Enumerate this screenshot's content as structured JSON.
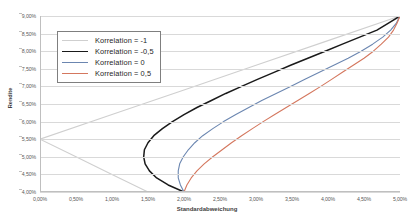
{
  "chart_data": {
    "type": "line",
    "title": "",
    "xlabel": "Standardabweichung",
    "ylabel": "Rendite",
    "xlim": [
      0.0,
      5.0
    ],
    "ylim": [
      4.0,
      9.0
    ],
    "x_ticks": [
      "0,00%",
      "0,50%",
      "1,00%",
      "1,50%",
      "2,00%",
      "2,50%",
      "3,00%",
      "3,50%",
      "4,00%",
      "4,50%",
      "5,00%"
    ],
    "x_tick_values": [
      0.0,
      0.5,
      1.0,
      1.5,
      2.0,
      2.5,
      3.0,
      3.5,
      4.0,
      4.5,
      5.0
    ],
    "y_ticks": [
      "9,00%",
      "8,50%",
      "8,00%",
      "7,50%",
      "7,00%",
      "6,50%",
      "6,00%",
      "5,50%",
      "5,00%",
      "4,50%",
      "4,00%"
    ],
    "y_tick_values": [
      9.0,
      8.5,
      8.0,
      7.5,
      7.0,
      6.5,
      6.0,
      5.5,
      5.0,
      4.5,
      4.0
    ],
    "grid": true,
    "legend_position": "upper-left-inset",
    "series": [
      {
        "name": "Korrelation = -1",
        "color": "#cfcfcf",
        "points": [
          [
            0.0,
            5.5
          ],
          [
            0.5,
            5.0
          ],
          [
            1.0,
            4.5
          ],
          [
            1.5,
            4.0
          ]
        ],
        "points_upper": [
          [
            0.0,
            5.5
          ],
          [
            1.0,
            6.2
          ],
          [
            2.0,
            6.9
          ],
          [
            3.0,
            7.6
          ],
          [
            4.0,
            8.3
          ],
          [
            5.0,
            9.0
          ]
        ]
      },
      {
        "name": "Korrelation = -0,5",
        "color": "#1a1a1a",
        "points": [
          [
            2.0,
            4.0
          ],
          [
            1.78,
            4.2
          ],
          [
            1.62,
            4.4
          ],
          [
            1.52,
            4.6
          ],
          [
            1.46,
            4.8
          ],
          [
            1.44,
            5.0
          ],
          [
            1.45,
            5.2
          ],
          [
            1.5,
            5.4
          ],
          [
            1.58,
            5.6
          ],
          [
            1.7,
            5.8
          ],
          [
            1.84,
            6.0
          ],
          [
            2.0,
            6.2
          ],
          [
            2.18,
            6.4
          ],
          [
            2.38,
            6.6
          ],
          [
            2.58,
            6.8
          ],
          [
            2.8,
            7.0
          ],
          [
            3.02,
            7.2
          ],
          [
            3.25,
            7.4
          ],
          [
            3.48,
            7.6
          ],
          [
            3.72,
            7.8
          ],
          [
            3.96,
            8.0
          ],
          [
            4.2,
            8.2
          ],
          [
            4.44,
            8.4
          ],
          [
            4.68,
            8.6
          ],
          [
            4.84,
            8.8
          ],
          [
            5.0,
            9.0
          ]
        ]
      },
      {
        "name": "Korrelation = 0",
        "color": "#6b86b0",
        "points": [
          [
            2.0,
            4.0
          ],
          [
            1.95,
            4.2
          ],
          [
            1.92,
            4.4
          ],
          [
            1.92,
            4.6
          ],
          [
            1.94,
            4.8
          ],
          [
            1.99,
            5.0
          ],
          [
            2.06,
            5.2
          ],
          [
            2.15,
            5.4
          ],
          [
            2.26,
            5.6
          ],
          [
            2.4,
            5.8
          ],
          [
            2.55,
            6.0
          ],
          [
            2.72,
            6.2
          ],
          [
            2.9,
            6.4
          ],
          [
            3.08,
            6.6
          ],
          [
            3.28,
            6.8
          ],
          [
            3.48,
            7.0
          ],
          [
            3.68,
            7.2
          ],
          [
            3.88,
            7.4
          ],
          [
            4.08,
            7.6
          ],
          [
            4.28,
            7.8
          ],
          [
            4.46,
            8.0
          ],
          [
            4.62,
            8.2
          ],
          [
            4.76,
            8.4
          ],
          [
            4.87,
            8.6
          ],
          [
            4.95,
            8.8
          ],
          [
            5.0,
            9.0
          ]
        ]
      },
      {
        "name": "Korrelation = 0,5",
        "color": "#d4775e",
        "points": [
          [
            2.0,
            4.0
          ],
          [
            2.04,
            4.2
          ],
          [
            2.1,
            4.4
          ],
          [
            2.18,
            4.6
          ],
          [
            2.28,
            4.8
          ],
          [
            2.4,
            5.0
          ],
          [
            2.53,
            5.2
          ],
          [
            2.66,
            5.4
          ],
          [
            2.8,
            5.6
          ],
          [
            2.95,
            5.8
          ],
          [
            3.1,
            6.0
          ],
          [
            3.26,
            6.2
          ],
          [
            3.42,
            6.4
          ],
          [
            3.58,
            6.6
          ],
          [
            3.74,
            6.8
          ],
          [
            3.9,
            7.0
          ],
          [
            4.05,
            7.2
          ],
          [
            4.2,
            7.4
          ],
          [
            4.35,
            7.6
          ],
          [
            4.5,
            7.8
          ],
          [
            4.63,
            8.0
          ],
          [
            4.74,
            8.2
          ],
          [
            4.84,
            8.4
          ],
          [
            4.91,
            8.6
          ],
          [
            4.96,
            8.8
          ],
          [
            5.0,
            9.0
          ]
        ]
      }
    ]
  },
  "legend": {
    "items": [
      {
        "label": "Korrelation = -1",
        "color": "#cfcfcf"
      },
      {
        "label": "Korrelation = -0,5",
        "color": "#1a1a1a"
      },
      {
        "label": "Korrelation = 0",
        "color": "#6b86b0"
      },
      {
        "label": "Korrelation = 0,5",
        "color": "#d4775e"
      }
    ]
  }
}
